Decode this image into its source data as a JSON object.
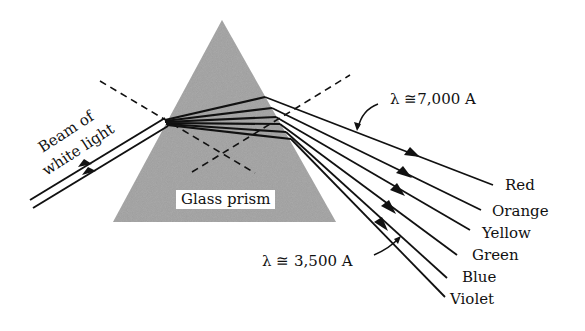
{
  "figure": {
    "prism_label": "Glass prism",
    "beam_label_line1": "Beam of",
    "beam_label_line2": "white light",
    "lambda_long": "λ ≅7,000 A",
    "lambda_short": "λ ≅ 3,500 A",
    "spectrum": [
      {
        "label": "Red"
      },
      {
        "label": "Orange"
      },
      {
        "label": "Yellow"
      },
      {
        "label": "Green"
      },
      {
        "label": "Blue"
      },
      {
        "label": "Violet"
      }
    ],
    "colors": {
      "prism_fill": "#9a9a9a",
      "line": "#111111",
      "background": "#ffffff"
    }
  }
}
